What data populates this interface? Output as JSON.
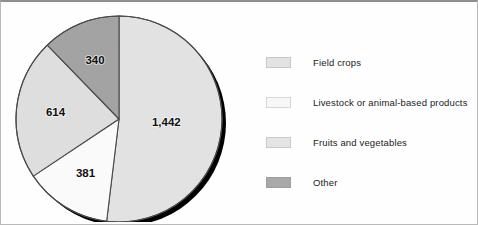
{
  "chart_data": {
    "type": "pie",
    "title": "",
    "subtitle": "",
    "xlabel": "",
    "ylabel": "",
    "total": 2777,
    "legend_position": "right",
    "grid": false,
    "start_angle_deg": 0,
    "direction": "clockwise",
    "categories": [
      "Field crops",
      "Livestock or animal-based products",
      "Fruits and vegetables",
      "Other"
    ],
    "values": [
      1442,
      381,
      614,
      340
    ],
    "value_labels": [
      "1,442",
      "381",
      "614",
      "340"
    ],
    "colors": [
      "#e2e2e2",
      "#fafafa",
      "#dedede",
      "#a3a3a3"
    ],
    "slices": [
      {
        "label": "Field crops",
        "value": 1442,
        "value_label": "1,442",
        "color": "#e2e2e2",
        "start_angle_deg": 0,
        "sweep_angle_deg": 186.9,
        "percent": 51.9
      },
      {
        "label": "Livestock or animal-based products",
        "value": 381,
        "value_label": "381",
        "color": "#fafafa",
        "start_angle_deg": 186.9,
        "sweep_angle_deg": 49.4,
        "percent": 13.7
      },
      {
        "label": "Fruits and vegetables",
        "value": 614,
        "value_label": "614",
        "color": "#dedede",
        "start_angle_deg": 236.3,
        "sweep_angle_deg": 79.6,
        "percent": 22.1
      },
      {
        "label": "Other",
        "value": 340,
        "value_label": "340",
        "color": "#a3a3a3",
        "start_angle_deg": 315.9,
        "sweep_angle_deg": 44.1,
        "percent": 12.2
      }
    ]
  },
  "legend": {
    "items": [
      {
        "label": "Field crops",
        "color": "#e2e2e2"
      },
      {
        "label": "Livestock or animal-based products",
        "color": "#f7f7f7"
      },
      {
        "label": "Fruits and vegetables",
        "color": "#e4e4e4"
      },
      {
        "label": "Other",
        "color": "#a8a8a8"
      }
    ]
  },
  "style": {
    "slice_outline": "#4a4a4a",
    "shadow_color": "#000000",
    "frame_color": "#b9b9b9"
  }
}
